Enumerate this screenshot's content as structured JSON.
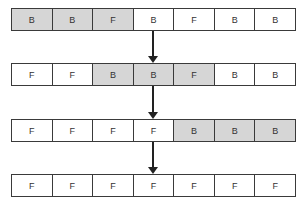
{
  "diagram": {
    "legend": {
      "highlight_color": "#d6d6d6",
      "normal_color": "#ffffff"
    },
    "rows": [
      {
        "cells": [
          {
            "label": "B",
            "highlighted": true
          },
          {
            "label": "B",
            "highlighted": true
          },
          {
            "label": "F",
            "highlighted": true
          },
          {
            "label": "B",
            "highlighted": false
          },
          {
            "label": "F",
            "highlighted": false
          },
          {
            "label": "B",
            "highlighted": false
          },
          {
            "label": "B",
            "highlighted": false
          }
        ]
      },
      {
        "cells": [
          {
            "label": "F",
            "highlighted": false
          },
          {
            "label": "F",
            "highlighted": false
          },
          {
            "label": "B",
            "highlighted": true
          },
          {
            "label": "B",
            "highlighted": true
          },
          {
            "label": "F",
            "highlighted": true
          },
          {
            "label": "B",
            "highlighted": false
          },
          {
            "label": "B",
            "highlighted": false
          }
        ]
      },
      {
        "cells": [
          {
            "label": "F",
            "highlighted": false
          },
          {
            "label": "F",
            "highlighted": false
          },
          {
            "label": "F",
            "highlighted": false
          },
          {
            "label": "F",
            "highlighted": false
          },
          {
            "label": "B",
            "highlighted": true
          },
          {
            "label": "B",
            "highlighted": true
          },
          {
            "label": "B",
            "highlighted": true
          }
        ]
      },
      {
        "cells": [
          {
            "label": "F",
            "highlighted": false
          },
          {
            "label": "F",
            "highlighted": false
          },
          {
            "label": "F",
            "highlighted": false
          },
          {
            "label": "F",
            "highlighted": false
          },
          {
            "label": "F",
            "highlighted": false
          },
          {
            "label": "F",
            "highlighted": false
          },
          {
            "label": "F",
            "highlighted": false
          }
        ]
      }
    ],
    "arrows": [
      {
        "from_row": 0,
        "to_row": 1,
        "icon": "arrow-down-icon"
      },
      {
        "from_row": 1,
        "to_row": 2,
        "icon": "arrow-down-icon"
      },
      {
        "from_row": 2,
        "to_row": 3,
        "icon": "arrow-down-icon"
      }
    ]
  }
}
